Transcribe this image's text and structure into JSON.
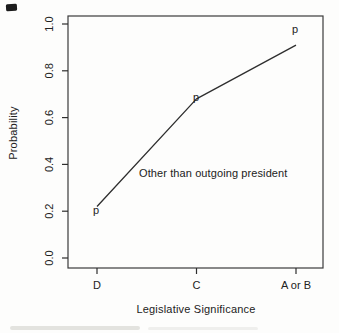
{
  "figure": {
    "colors": {
      "ink": "#2e2e2e",
      "text": "#222222",
      "paper": "#fdfdfc"
    }
  },
  "chart_data": {
    "type": "line",
    "title": "",
    "xlabel": "Legislative Significance",
    "ylabel": "Probability",
    "categories": [
      "D",
      "C",
      "A or B"
    ],
    "values": [
      0.22,
      0.68,
      0.91
    ],
    "point_marker": "p",
    "annotation": {
      "text": "Other than outgoing president"
    },
    "ylim": [
      0.0,
      1.0
    ],
    "yticks": [
      0.0,
      0.2,
      0.4,
      0.6,
      0.8,
      1.0
    ],
    "grid": false,
    "legend_position": "none"
  }
}
